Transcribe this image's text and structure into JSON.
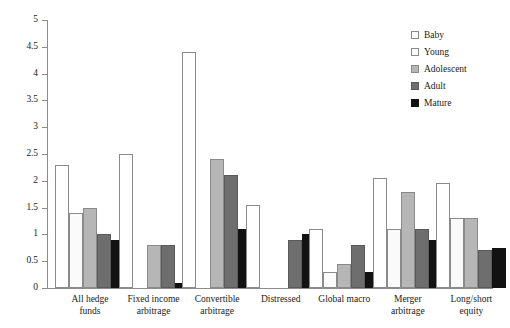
{
  "chart_data": {
    "type": "bar",
    "title": "",
    "xlabel": "",
    "ylabel": "",
    "ylim": [
      0,
      5
    ],
    "ytick_values": [
      0,
      0.5,
      1,
      1.5,
      2,
      2.5,
      3,
      3.5,
      4,
      4.5,
      5
    ],
    "ytick_labels": [
      "0",
      "0.5",
      "1",
      "1.5",
      "2",
      "2.5",
      "3",
      "3.5",
      "4",
      "4.5",
      "5"
    ],
    "grid": false,
    "legend_position": "top-right",
    "categories": [
      "All hedge funds",
      "Fixed income arbitrage",
      "Convertible arbitrage",
      "Distressed",
      "Global macro",
      "Merger arbitrage",
      "Long/short equity"
    ],
    "category_label_lines": [
      [
        "All hedge",
        "funds"
      ],
      [
        "Fixed income",
        "arbitrage"
      ],
      [
        "Convertible",
        "arbitrage"
      ],
      [
        "Distressed",
        ""
      ],
      [
        "Global macro",
        ""
      ],
      [
        "Merger",
        "arbitrage"
      ],
      [
        "Long/short",
        "equity"
      ]
    ],
    "series": [
      {
        "name": "Baby",
        "color": "#ffffff",
        "values": [
          2.3,
          2.5,
          4.4,
          1.55,
          1.1,
          2.05,
          1.95
        ]
      },
      {
        "name": "Young",
        "color": "#fafafa",
        "values": [
          1.4,
          0,
          0,
          0,
          0.3,
          1.1,
          1.3
        ]
      },
      {
        "name": "Adolescent",
        "color": "#b6b6b6",
        "values": [
          1.5,
          0.8,
          2.4,
          0,
          0.45,
          1.8,
          1.3
        ]
      },
      {
        "name": "Adult",
        "color": "#6e6e6e",
        "values": [
          1.0,
          0.8,
          2.1,
          0.9,
          0.8,
          1.1,
          0.7
        ]
      },
      {
        "name": "Mature",
        "color": "#121212",
        "values": [
          0.9,
          0.1,
          1.1,
          1.0,
          0.3,
          0.9,
          0.75
        ]
      }
    ]
  },
  "legend": {
    "items": [
      {
        "label": "Baby"
      },
      {
        "label": "Young"
      },
      {
        "label": "Adolescent"
      },
      {
        "label": "Adult"
      },
      {
        "label": "Mature"
      }
    ]
  }
}
